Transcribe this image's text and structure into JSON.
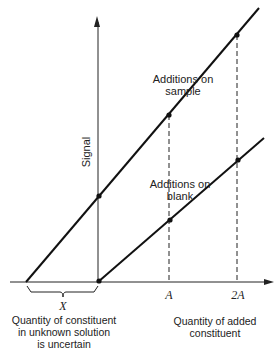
{
  "diagram": {
    "axes": {
      "y_label": "Signal",
      "x_label_line1": "Quantity of added",
      "x_label_line2": "constituent",
      "x_ticks": [
        "A",
        "2A"
      ]
    },
    "lines": [
      {
        "name": "Additions on sample",
        "label_line1": "Additions on",
        "label_line2": "sample",
        "points": [
          [
            0,
            1
          ],
          [
            1,
            2
          ],
          [
            2,
            3
          ]
        ],
        "x_intercept": "-X"
      },
      {
        "name": "Additions on blank",
        "label_line1": "Additions on",
        "label_line2": "blank",
        "points": [
          [
            0,
            0
          ],
          [
            1,
            1
          ],
          [
            2,
            2
          ]
        ],
        "x_intercept": "0"
      }
    ],
    "brace": {
      "symbol": "X",
      "caption_line1": "Quantity of constituent",
      "caption_line2": "in unknown solution",
      "caption_line3": "is uncertain"
    },
    "colors": {
      "line": "#111111",
      "background": "#ffffff"
    }
  }
}
